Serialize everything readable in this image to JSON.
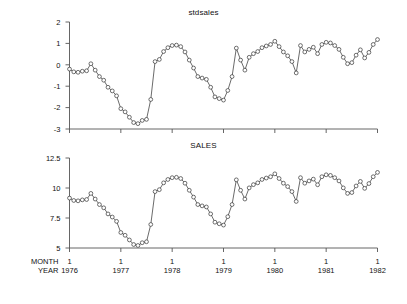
{
  "figure": {
    "background": "#ffffff",
    "line_color": "#3a3a3a",
    "marker_face": "#ffffff",
    "marker_edge": "#333333",
    "axis_color": "#555555"
  },
  "axis_labels": {
    "month_label": "MONTH",
    "year_label": "YEAR"
  },
  "chart_data": [
    {
      "type": "line",
      "title": "stdsales",
      "xlabel": "",
      "ylabel": "",
      "ylim": [
        -3,
        2
      ],
      "yticks": [
        2,
        1,
        0,
        -1,
        -2,
        -3
      ],
      "ytick_labels": [
        "2",
        "1",
        "0",
        "-1",
        "-2",
        "-3"
      ],
      "xlim": [
        0,
        72
      ],
      "xticks": [
        0,
        12,
        24,
        36,
        48,
        60,
        72
      ],
      "xtick_month_labels": [
        "1",
        "1",
        "1",
        "1",
        "1",
        "1",
        "1"
      ],
      "xtick_year_labels": [
        "1976",
        "1977",
        "1978",
        "1979",
        "1980",
        "1981",
        "1982"
      ],
      "grid": false,
      "legend": "none",
      "markers": "open-circle",
      "x": [
        0,
        1,
        2,
        3,
        4,
        5,
        6,
        7,
        8,
        9,
        10,
        11,
        12,
        13,
        14,
        15,
        16,
        17,
        18,
        19,
        20,
        21,
        22,
        23,
        24,
        25,
        26,
        27,
        28,
        29,
        30,
        31,
        32,
        33,
        34,
        35,
        36,
        37,
        38,
        39,
        40,
        41,
        42,
        43,
        44,
        45,
        46,
        47,
        48,
        49,
        50,
        51,
        52,
        53,
        54,
        55,
        56,
        57,
        58,
        59,
        60,
        61,
        62,
        63,
        64,
        65,
        66,
        67,
        68,
        69,
        70,
        71,
        72
      ],
      "values": [
        -0.2,
        -0.33,
        -0.35,
        -0.3,
        -0.28,
        0.05,
        -0.25,
        -0.55,
        -0.72,
        -1.05,
        -1.22,
        -1.45,
        -2.05,
        -2.2,
        -2.45,
        -2.7,
        -2.75,
        -2.6,
        -2.55,
        -1.62,
        0.15,
        0.25,
        0.62,
        0.8,
        0.9,
        0.92,
        0.85,
        0.6,
        0.22,
        -0.15,
        -0.55,
        -0.62,
        -0.68,
        -1.05,
        -1.5,
        -1.58,
        -1.65,
        -1.2,
        -0.55,
        0.78,
        0.22,
        -0.25,
        0.35,
        0.52,
        0.62,
        0.8,
        0.88,
        0.95,
        1.1,
        0.85,
        0.6,
        0.42,
        0.15,
        -0.38,
        0.9,
        0.6,
        0.72,
        0.82,
        0.52,
        0.95,
        1.05,
        1.02,
        0.9,
        0.72,
        0.35,
        0.05,
        0.1,
        0.45,
        0.7,
        0.32,
        0.58,
        0.95,
        1.18
      ]
    },
    {
      "type": "line",
      "title": "SALES",
      "xlabel": "",
      "ylabel": "",
      "ylim": [
        5,
        12.5
      ],
      "yticks": [
        12.5,
        10,
        7.5,
        5
      ],
      "ytick_labels": [
        "12.5",
        "10",
        "7.5",
        "5"
      ],
      "xlim": [
        0,
        72
      ],
      "xticks": [
        0,
        12,
        24,
        36,
        48,
        60,
        72
      ],
      "xtick_month_labels": [
        "1",
        "1",
        "1",
        "1",
        "1",
        "1",
        "1"
      ],
      "xtick_year_labels": [
        "1976",
        "1977",
        "1978",
        "1979",
        "1980",
        "1981",
        "1982"
      ],
      "grid": false,
      "legend": "none",
      "markers": "open-circle",
      "x": [
        0,
        1,
        2,
        3,
        4,
        5,
        6,
        7,
        8,
        9,
        10,
        11,
        12,
        13,
        14,
        15,
        16,
        17,
        18,
        19,
        20,
        21,
        22,
        23,
        24,
        25,
        26,
        27,
        28,
        29,
        30,
        31,
        32,
        33,
        34,
        35,
        36,
        37,
        38,
        39,
        40,
        41,
        42,
        43,
        44,
        45,
        46,
        47,
        48,
        49,
        50,
        51,
        52,
        53,
        54,
        55,
        56,
        57,
        58,
        59,
        60,
        61,
        62,
        63,
        64,
        65,
        66,
        67,
        68,
        69,
        70,
        71,
        72
      ],
      "values": [
        9.16,
        8.96,
        8.93,
        9.01,
        9.04,
        9.55,
        9.08,
        8.62,
        8.35,
        7.84,
        7.58,
        7.22,
        6.29,
        6.06,
        5.67,
        5.29,
        5.21,
        5.44,
        5.52,
        6.96,
        9.7,
        9.86,
        10.43,
        10.71,
        10.86,
        10.89,
        10.79,
        10.4,
        9.81,
        9.24,
        8.62,
        8.51,
        8.42,
        7.84,
        7.15,
        7.02,
        6.91,
        7.61,
        8.62,
        10.68,
        9.81,
        9.08,
        10.01,
        10.28,
        10.43,
        10.71,
        10.83,
        10.94,
        11.18,
        10.79,
        10.4,
        10.12,
        9.7,
        8.88,
        10.86,
        10.4,
        10.59,
        10.74,
        10.27,
        10.94,
        11.1,
        11.05,
        10.86,
        10.59,
        10.01,
        9.55,
        9.62,
        10.17,
        10.55,
        9.97,
        10.37,
        10.94,
        11.3
      ]
    }
  ]
}
